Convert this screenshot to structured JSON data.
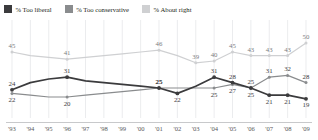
{
  "legend": {
    "items": [
      {
        "label": "% Too liberal",
        "color": "#3b3b3d",
        "name": "legend-too-liberal"
      },
      {
        "label": "% Too conservative",
        "color": "#8a8c8e",
        "name": "legend-too-conservative"
      },
      {
        "label": "% About right",
        "color": "#cfd0d2",
        "name": "legend-about-right"
      }
    ]
  },
  "chart_data": {
    "type": "line",
    "title": "",
    "xlabel": "",
    "ylabel": "",
    "ylim": [
      15,
      55
    ],
    "grid": true,
    "legend_position": "top-left",
    "x": [
      "'93",
      "'94",
      "'95",
      "'96",
      "'97",
      "'98",
      "'99",
      "'00",
      "'01",
      "'02",
      "'03",
      "'04",
      "'05",
      "'06",
      "'07",
      "'08",
      "'09"
    ],
    "series": [
      {
        "name": "% Too liberal",
        "color": "#3b3b3d",
        "points": [
          {
            "x": "'93",
            "y": 24,
            "label": "24",
            "pos": "above"
          },
          {
            "x": "'96",
            "y": 31,
            "label": "31",
            "pos": "above"
          },
          {
            "x": "'01",
            "y": 25,
            "label": "25",
            "pos": "above"
          },
          {
            "x": "'02",
            "y": 22,
            "label": "22",
            "pos": "below"
          },
          {
            "x": "'04",
            "y": 31,
            "label": "31",
            "pos": "above"
          },
          {
            "x": "'05",
            "y": 28,
            "label": "28",
            "pos": "above"
          },
          {
            "x": "'06",
            "y": 25,
            "label": "25",
            "pos": "above"
          },
          {
            "x": "'07",
            "y": 21,
            "label": "21",
            "pos": "below"
          },
          {
            "x": "'08",
            "y": 21,
            "label": "21",
            "pos": "below"
          },
          {
            "x": "'09",
            "y": 19,
            "label": "19",
            "pos": "below"
          }
        ],
        "values": [
          24,
          28,
          30,
          31,
          29,
          28,
          27,
          26,
          25,
          22,
          26,
          31,
          28,
          25,
          21,
          21,
          19
        ]
      },
      {
        "name": "% Too conservative",
        "color": "#8a8c8e",
        "points": [
          {
            "x": "'93",
            "y": 22,
            "label": "22",
            "pos": "below"
          },
          {
            "x": "'96",
            "y": 20,
            "label": "20",
            "pos": "below"
          },
          {
            "x": "'01",
            "y": 25,
            "label": "25",
            "pos": "above"
          },
          {
            "x": "'04",
            "y": 25,
            "label": "25",
            "pos": "below"
          },
          {
            "x": "'05",
            "y": 27,
            "label": "27",
            "pos": "below"
          },
          {
            "x": "'06",
            "y": 25,
            "label": "25",
            "pos": "below"
          },
          {
            "x": "'07",
            "y": 31,
            "label": "31",
            "pos": "above"
          },
          {
            "x": "'08",
            "y": 32,
            "label": "32",
            "pos": "above"
          },
          {
            "x": "'09",
            "y": 28,
            "label": "28",
            "pos": "above"
          }
        ],
        "values": [
          22,
          21,
          20,
          20,
          21,
          22,
          23,
          24,
          25,
          25,
          25,
          25,
          27,
          25,
          31,
          32,
          28
        ]
      },
      {
        "name": "% About right",
        "color": "#cfd0d2",
        "points": [
          {
            "x": "'93",
            "y": 45,
            "label": "45",
            "pos": "above"
          },
          {
            "x": "'96",
            "y": 41,
            "label": "41",
            "pos": "above"
          },
          {
            "x": "'01",
            "y": 46,
            "label": "46",
            "pos": "above"
          },
          {
            "x": "'03",
            "y": 39,
            "label": "39",
            "pos": "above"
          },
          {
            "x": "'04",
            "y": 40,
            "label": "40",
            "pos": "above"
          },
          {
            "x": "'05",
            "y": 45,
            "label": "45",
            "pos": "above"
          },
          {
            "x": "'06",
            "y": 43,
            "label": "43",
            "pos": "above"
          },
          {
            "x": "'07",
            "y": 43,
            "label": "43",
            "pos": "above"
          },
          {
            "x": "'08",
            "y": 43,
            "label": "43",
            "pos": "above"
          },
          {
            "x": "'09",
            "y": 50,
            "label": "50",
            "pos": "above"
          }
        ],
        "values": [
          45,
          43,
          42,
          41,
          42,
          43,
          44,
          45,
          46,
          43,
          39,
          40,
          45,
          43,
          43,
          43,
          50
        ]
      }
    ]
  }
}
